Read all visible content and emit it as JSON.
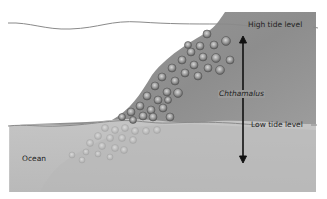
{
  "diagram": {
    "labels": {
      "high_tide": "High tide level",
      "low_tide": "Low tide level",
      "species": "Chthamalus",
      "ocean": "Ocean"
    },
    "colors": {
      "background": "#ffffff",
      "rock_dark": "#8c8c8c",
      "rock_mid": "#a3a3a3",
      "water": "#c4c4c4",
      "water_deep": "#b5b5b5",
      "tide_line": "#8a8a8a",
      "arrow": "#111111",
      "barnacle_fill": "#9a9a9a",
      "barnacle_edge": "#5a5a5a"
    }
  }
}
